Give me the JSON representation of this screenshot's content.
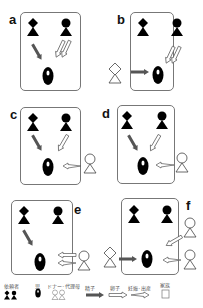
{
  "panels": [
    {
      "id": "a",
      "label": "a"
    },
    {
      "id": "b",
      "label": "b"
    },
    {
      "id": "c",
      "label": "c"
    },
    {
      "id": "d",
      "label": "d"
    },
    {
      "id": "e",
      "label": "e"
    },
    {
      "id": "f",
      "label": "f"
    }
  ],
  "legend": {
    "client": "依頼者",
    "child": "児",
    "donor_surrogate": "ドナー･代理母",
    "sperm": "精子",
    "egg": "卵子",
    "pregnancy_birth": "妊娠･出産",
    "family": "家族"
  },
  "colors": {
    "figure_fill": "#000000",
    "box_border": "#777777",
    "sperm_arrow": "#555555",
    "outline": "#444444"
  }
}
